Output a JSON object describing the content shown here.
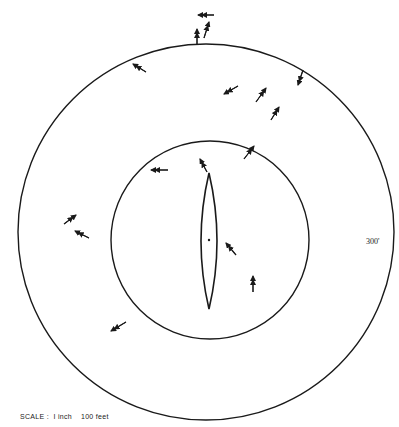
{
  "diagram": {
    "outer_circle": {
      "cx": 206,
      "cy": 232,
      "r": 188,
      "label": "300'"
    },
    "inner_circle": {
      "cx": 210,
      "cy": 240,
      "r": 99
    },
    "lens": {
      "cx": 209,
      "top": 173,
      "bottom": 309,
      "halfwidth": 8
    },
    "center_dot": {
      "x": 209,
      "y": 240
    },
    "scale_label": "SCALE :  I inch    100 feet",
    "stroke_color": "#1a1a1a",
    "arrows": [
      {
        "x1": 214,
        "y1": 15,
        "x2": 198,
        "y2": 15,
        "double": true
      },
      {
        "x1": 204,
        "y1": 38,
        "x2": 209,
        "y2": 22,
        "double": true
      },
      {
        "x1": 197,
        "y1": 45,
        "x2": 197,
        "y2": 29,
        "double": true
      },
      {
        "x1": 146,
        "y1": 72,
        "x2": 133,
        "y2": 64,
        "double": true
      },
      {
        "x1": 238,
        "y1": 86,
        "x2": 224,
        "y2": 94,
        "double": true
      },
      {
        "x1": 256,
        "y1": 102,
        "x2": 266,
        "y2": 88,
        "double": true
      },
      {
        "x1": 271,
        "y1": 120,
        "x2": 279,
        "y2": 107,
        "double": true
      },
      {
        "x1": 303,
        "y1": 70,
        "x2": 298,
        "y2": 85,
        "double": true
      },
      {
        "x1": 244,
        "y1": 159,
        "x2": 254,
        "y2": 146,
        "double": true
      },
      {
        "x1": 168,
        "y1": 170,
        "x2": 151,
        "y2": 170,
        "double": true
      },
      {
        "x1": 207,
        "y1": 172,
        "x2": 200,
        "y2": 159,
        "double": true
      },
      {
        "x1": 64,
        "y1": 224,
        "x2": 76,
        "y2": 215,
        "double": true
      },
      {
        "x1": 89,
        "y1": 238,
        "x2": 75,
        "y2": 231,
        "double": true
      },
      {
        "x1": 236,
        "y1": 255,
        "x2": 226,
        "y2": 243,
        "double": true
      },
      {
        "x1": 253,
        "y1": 292,
        "x2": 253,
        "y2": 276,
        "double": true
      },
      {
        "x1": 126,
        "y1": 322,
        "x2": 111,
        "y2": 331,
        "double": true
      }
    ]
  }
}
